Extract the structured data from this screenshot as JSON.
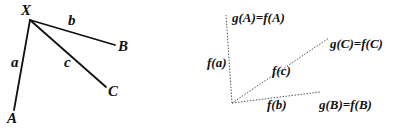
{
  "left_diagram": {
    "vertices": {
      "X": "X",
      "A": "A",
      "B": "B",
      "C": "C"
    },
    "edges": {
      "a": "a",
      "b": "b",
      "c": "c"
    },
    "line_style": "solid",
    "line_color": "#111111"
  },
  "right_diagram": {
    "labels": {
      "gA": "g(A)=f(A)",
      "gB": "g(B)=f(B)",
      "gC": "g(C)=f(C)",
      "fa": "f(a)",
      "fb": "f(b)",
      "fc": "f(c)"
    },
    "line_style": "dotted",
    "line_color": "#555555"
  }
}
